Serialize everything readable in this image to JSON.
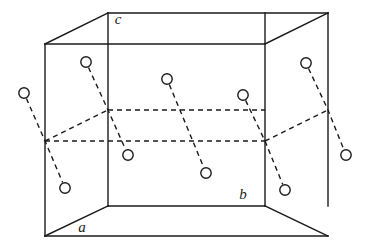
{
  "figure": {
    "type": "line-diagram",
    "width": 369,
    "height": 249,
    "background_color": "#ffffff",
    "line_color": "#1a1a1a",
    "molecule_color": "#1a1a1a",
    "solid_line_width": 1.4,
    "dashed_line_width": 1.4,
    "dash_pattern": "5,4",
    "circle_radius": 5.2,
    "circle_fill": "#ffffff"
  },
  "axis_labels": [
    {
      "name": "a",
      "text": "a",
      "x": 82,
      "y": 232
    },
    {
      "name": "b",
      "text": "b",
      "x": 243,
      "y": 199
    },
    {
      "name": "c",
      "text": "c",
      "x": 118,
      "y": 24
    }
  ],
  "cell_vertices": {
    "front_bottom_left": {
      "x": 108,
      "y": 206
    },
    "front_bottom_right": {
      "x": 265,
      "y": 206
    },
    "front_top_right": {
      "x": 265,
      "y": 44
    },
    "front_top_left": {
      "x": 108,
      "y": 44
    },
    "back_bottom_left": {
      "x": 45,
      "y": 236
    },
    "back_bottom_right": {
      "x": 328,
      "y": 236
    },
    "back_top_right": {
      "x": 328,
      "y": 13
    },
    "back_top_left": {
      "x": 45,
      "y": 13
    },
    "hidden_bottom_left": {
      "x": 45,
      "y": 141
    },
    "hidden_bottom_mid": {
      "x": 108,
      "y": 110
    },
    "hidden_bottom_mid_r": {
      "x": 265,
      "y": 141
    },
    "hidden_bottom_right": {
      "x": 328,
      "y": 110
    }
  },
  "solid_edges": [
    {
      "name": "left-vertical-front",
      "x1": 45,
      "y1": 44,
      "x2": 45,
      "y2": 236
    },
    {
      "name": "left-vertical-inner",
      "x1": 108,
      "y1": 13,
      "x2": 108,
      "y2": 206
    },
    {
      "name": "right-vertical-inner",
      "x1": 265,
      "y1": 13,
      "x2": 265,
      "y2": 206
    },
    {
      "name": "right-vertical-back",
      "x1": 328,
      "y1": 13,
      "x2": 328,
      "y2": 206
    },
    {
      "name": "top-back-horizontal",
      "x1": 108,
      "y1": 13,
      "x2": 328,
      "y2": 13
    },
    {
      "name": "top-front-horizontal",
      "x1": 45,
      "y1": 44,
      "x2": 265,
      "y2": 44
    },
    {
      "name": "top-left-diagonal",
      "x1": 45,
      "y1": 44,
      "x2": 108,
      "y2": 13
    },
    {
      "name": "top-right-diagonal",
      "x1": 265,
      "y1": 44,
      "x2": 328,
      "y2": 13
    },
    {
      "name": "bottom-front-horizontal",
      "x1": 108,
      "y1": 206,
      "x2": 265,
      "y2": 206
    },
    {
      "name": "bottom-back-horizontal",
      "x1": 45,
      "y1": 236,
      "x2": 328,
      "y2": 236
    },
    {
      "name": "bottom-left-diagonal",
      "x1": 45,
      "y1": 236,
      "x2": 108,
      "y2": 206
    },
    {
      "name": "bottom-right-diagonal",
      "x1": 265,
      "y1": 206,
      "x2": 328,
      "y2": 236
    }
  ],
  "hidden_edges": [
    {
      "name": "hidden-left-diagonal",
      "x1": 45,
      "y1": 141,
      "x2": 108,
      "y2": 110
    },
    {
      "name": "hidden-back-horizontal",
      "x1": 108,
      "y1": 110,
      "x2": 265,
      "y2": 110
    },
    {
      "name": "hidden-right-diagonal",
      "x1": 265,
      "y1": 141,
      "x2": 328,
      "y2": 110
    },
    {
      "name": "hidden-left-horizontal",
      "x1": 45,
      "y1": 141,
      "x2": 265,
      "y2": 141
    }
  ],
  "molecules": [
    {
      "name": "molecule-1",
      "atom_a": {
        "x": 24,
        "y": 93
      },
      "atom_b": {
        "x": 65,
        "y": 188
      },
      "bond_through": {
        "x": 45,
        "y": 141
      }
    },
    {
      "name": "molecule-2",
      "atom_a": {
        "x": 86,
        "y": 62
      },
      "atom_b": {
        "x": 128,
        "y": 155
      },
      "bond_through": {
        "x": 108,
        "y": 110
      }
    },
    {
      "name": "molecule-3",
      "atom_a": {
        "x": 167,
        "y": 79
      },
      "atom_b": {
        "x": 206,
        "y": 173
      },
      "bond_through": {
        "x": 187,
        "y": 127
      }
    },
    {
      "name": "molecule-4",
      "atom_a": {
        "x": 243,
        "y": 95
      },
      "atom_b": {
        "x": 285,
        "y": 190
      },
      "bond_through": {
        "x": 265,
        "y": 141
      }
    },
    {
      "name": "molecule-5",
      "atom_a": {
        "x": 306,
        "y": 63
      },
      "atom_b": {
        "x": 346,
        "y": 155
      },
      "bond_through": {
        "x": 328,
        "y": 110
      }
    }
  ]
}
